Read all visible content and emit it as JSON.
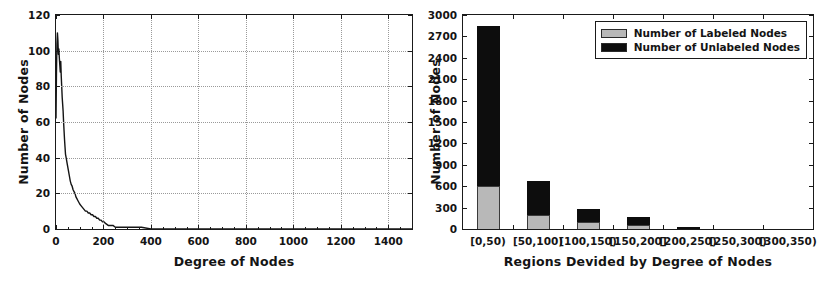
{
  "chart_data": [
    {
      "id": "degree-distribution",
      "type": "line",
      "title": "",
      "xlabel": "Degree of Nodes",
      "ylabel": "Number of Nodes",
      "xlim": [
        0,
        1500
      ],
      "ylim": [
        0,
        120
      ],
      "xticks": [
        0,
        200,
        400,
        600,
        800,
        1000,
        1200,
        1400
      ],
      "yticks": [
        0,
        20,
        40,
        60,
        80,
        100,
        120
      ],
      "grid": true,
      "legend": "none",
      "series_name": "Number of Nodes",
      "series_color": "#141414",
      "x": [
        0,
        2,
        4,
        6,
        8,
        10,
        12,
        14,
        16,
        18,
        20,
        22,
        24,
        26,
        28,
        30,
        32,
        34,
        36,
        38,
        40,
        44,
        48,
        52,
        56,
        60,
        64,
        68,
        72,
        76,
        80,
        84,
        88,
        92,
        96,
        100,
        106,
        112,
        118,
        124,
        130,
        136,
        142,
        148,
        154,
        160,
        166,
        172,
        178,
        184,
        190,
        196,
        202,
        210,
        220,
        230,
        240,
        250,
        260,
        275,
        290,
        305,
        320,
        340,
        360,
        400,
        450,
        500,
        600,
        700,
        800,
        900,
        1000,
        1100,
        1200,
        1300,
        1400,
        1500
      ],
      "y": [
        62,
        88,
        104,
        110,
        106,
        98,
        101,
        96,
        92,
        88,
        94,
        86,
        80,
        74,
        70,
        66,
        60,
        55,
        50,
        46,
        42,
        39,
        36,
        33,
        30,
        27,
        25,
        24,
        22,
        21,
        20,
        18,
        17,
        16,
        15,
        14,
        13,
        12,
        11,
        10,
        10,
        9,
        9,
        8,
        8,
        7,
        7,
        6,
        6,
        5,
        5,
        4,
        4,
        3,
        2,
        2,
        2,
        1,
        1,
        1,
        1,
        1,
        1,
        1,
        1,
        0,
        0,
        0,
        0,
        0,
        0,
        0,
        0,
        0,
        0,
        0,
        0,
        0
      ]
    },
    {
      "id": "labeled-vs-unlabeled-by-region",
      "type": "bar",
      "bar_mode": "stacked",
      "title": "",
      "xlabel": "Regions Devided by Degree of Nodes",
      "ylabel": "Number of Nodes",
      "ylim": [
        0,
        3000
      ],
      "yticks": [
        0,
        300,
        600,
        900,
        1200,
        1500,
        1800,
        2100,
        2400,
        2700,
        3000
      ],
      "grid": false,
      "legend_position": "upper right",
      "categories": [
        "[0,50)",
        "[50,100)",
        "[100,150)",
        "[150,200]",
        "[200,250)",
        "[250,300)",
        "[300,350)"
      ],
      "series": [
        {
          "name": "Number of Labeled Nodes",
          "color": "#b8b8b8",
          "values": [
            600,
            190,
            100,
            55,
            8,
            0,
            0
          ]
        },
        {
          "name": "Number of Unlabeled Nodes",
          "color": "#0d0d0d",
          "values": [
            2250,
            485,
            175,
            115,
            22,
            0,
            0
          ]
        }
      ],
      "totals": [
        2850,
        675,
        275,
        170,
        30,
        0,
        0
      ]
    }
  ],
  "left_chart": {
    "ylabel": "Number of Nodes",
    "xlabel": "Degree of Nodes",
    "yticks": [
      "0",
      "20",
      "40",
      "60",
      "80",
      "100",
      "120"
    ],
    "xticks": [
      "0",
      "200",
      "400",
      "600",
      "800",
      "1000",
      "1200",
      "1400"
    ]
  },
  "right_chart": {
    "ylabel": "Number of Nodes",
    "xlabel": "Regions Devided by Degree of Nodes",
    "yticks": [
      "0",
      "300",
      "600",
      "900",
      "1200",
      "1500",
      "1800",
      "2100",
      "2400",
      "2700",
      "3000"
    ],
    "xticks": [
      "[0,50)",
      "[50,100)",
      "[100,150)",
      "[150,200]",
      "[200,250)",
      "[250,300)",
      "[300,350)"
    ],
    "legend": [
      {
        "label": "Number of Labeled Nodes",
        "swatch": "#b8b8b8"
      },
      {
        "label": "Number of Unlabeled Nodes",
        "swatch": "#0d0d0d"
      }
    ]
  }
}
